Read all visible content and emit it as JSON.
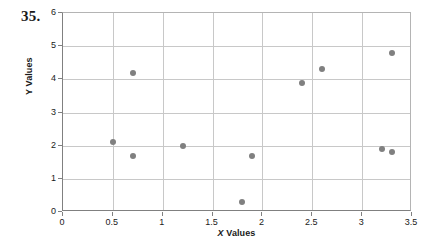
{
  "problem": {
    "number": "35."
  },
  "chart_data": {
    "type": "scatter",
    "title": "",
    "xlabel": "X Values",
    "xlabel_italic_prefix": "X",
    "xlabel_rest": " Values",
    "ylabel": "Y Values",
    "xlim": [
      0,
      3.5
    ],
    "ylim": [
      0,
      6
    ],
    "xticks": [
      0,
      0.5,
      1,
      1.5,
      2,
      2.5,
      3,
      3.5
    ],
    "xtick_labels": [
      "0",
      "0.5",
      "1",
      "1.5",
      "2",
      "2.5",
      "3",
      "3.5"
    ],
    "yticks": [
      0,
      1,
      2,
      3,
      4,
      5,
      6
    ],
    "ytick_labels": [
      "0",
      "1",
      "2",
      "3",
      "4",
      "5",
      "6"
    ],
    "grid": true,
    "grid_color": "#c8c8c8",
    "grid_x_values": [
      0.5,
      1,
      1.5,
      2,
      2.5,
      3
    ],
    "grid_y_values": [
      1,
      2,
      3,
      4,
      5
    ],
    "legend": null,
    "marker_color": "#808080",
    "marker_shape": "circle",
    "marker_size_px": 6,
    "points": [
      {
        "x": 0.5,
        "y": 2.1
      },
      {
        "x": 0.7,
        "y": 4.2
      },
      {
        "x": 0.7,
        "y": 1.7
      },
      {
        "x": 1.2,
        "y": 2.0
      },
      {
        "x": 1.8,
        "y": 0.3
      },
      {
        "x": 1.9,
        "y": 1.7
      },
      {
        "x": 2.4,
        "y": 3.9
      },
      {
        "x": 2.6,
        "y": 4.3
      },
      {
        "x": 3.2,
        "y": 1.9
      },
      {
        "x": 3.3,
        "y": 1.8
      },
      {
        "x": 3.3,
        "y": 4.8
      }
    ]
  }
}
